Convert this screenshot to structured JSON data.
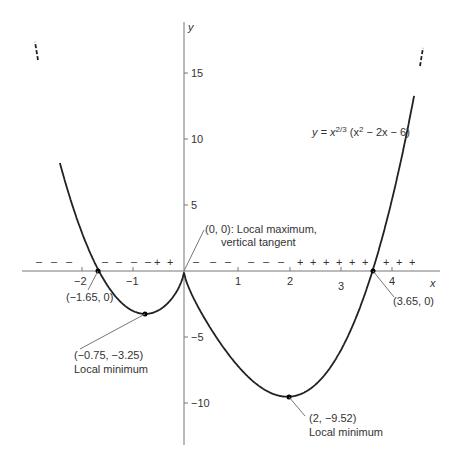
{
  "chart_data": {
    "type": "line",
    "title": "",
    "function_label": "y = x^(2/3) (x^2 − 2x − 6)",
    "xlabel": "x",
    "ylabel": "y",
    "xlim": [
      -3.1,
      4.9
    ],
    "ylim": [
      -12.5,
      19
    ],
    "grid": false,
    "x_ticks": [
      -2,
      -1,
      1,
      2,
      3,
      4
    ],
    "x_tick_labels": [
      "−2",
      "−1",
      "1",
      "2",
      "3",
      "4"
    ],
    "y_ticks": [
      15,
      10,
      5,
      -5,
      -10
    ],
    "y_tick_labels": [
      "15",
      "10",
      "5",
      "−5",
      "−10"
    ],
    "series": [
      {
        "name": "y = x^(2/3)(x^2 − 2x − 6)",
        "domain": [
          -2.4,
          4.45
        ]
      }
    ],
    "points": [
      {
        "x": -1.65,
        "y": 0,
        "label": "(−1.65, 0)",
        "note": ""
      },
      {
        "x": -0.75,
        "y": -3.25,
        "label": "(−0.75, −3.25)",
        "note": "Local minimum"
      },
      {
        "x": 0,
        "y": 0,
        "label": "(0, 0): Local maximum,",
        "note": "vertical tangent"
      },
      {
        "x": 2,
        "y": -9.52,
        "label": "(2, −9.52)",
        "note": "Local minimum"
      },
      {
        "x": 3.65,
        "y": 0,
        "label": "(3.65, 0)",
        "note": ""
      }
    ],
    "sign_chart": {
      "segments": [
        {
          "from": -2.8,
          "to": -1.75,
          "sign": "−"
        },
        {
          "from": -1.55,
          "to": -0.55,
          "sign": "−"
        },
        {
          "from": -0.5,
          "to": -0.1,
          "sign": "+"
        },
        {
          "from": 0.1,
          "to": 2.0,
          "sign": "−"
        },
        {
          "from": 2.0,
          "to": 3.6,
          "sign": "+"
        },
        {
          "from": 3.7,
          "to": 4.5,
          "sign": "+"
        }
      ]
    }
  },
  "labels": {
    "x_axis": "x",
    "y_axis": "y",
    "function": "y = x",
    "function_exp": "2/3",
    "function_rest": " (x",
    "function_sq": "2",
    "function_tail": " − 2x − 6)",
    "p1": "(−1.65, 0)",
    "p2a": "(−0.75, −3.25)",
    "p2b": "Local minimum",
    "p3a": "(0, 0): Local maximum,",
    "p3b": "vertical tangent",
    "p4a": "(2, −9.52)",
    "p4b": "Local minimum",
    "p5": "(3.65, 0)",
    "xt": [
      "−2",
      "−1",
      "1",
      "2",
      "3",
      "4"
    ],
    "yt": [
      "15",
      "10",
      "5",
      "−5",
      "−10"
    ]
  }
}
